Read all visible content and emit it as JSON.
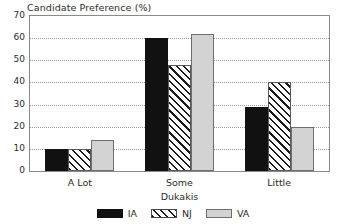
{
  "chart_data": {
    "type": "bar",
    "title": "Candidate Preference (%)",
    "xlabel": "Dukakis",
    "ylabel": "",
    "categories": [
      "A Lot",
      "Some",
      "Little"
    ],
    "series": [
      {
        "name": "IA",
        "values": [
          10,
          60,
          29
        ],
        "color": "#111111",
        "fill": "solid"
      },
      {
        "name": "NJ",
        "values": [
          10,
          48,
          40
        ],
        "color": "#1a1a1a",
        "fill": "diagonal-hatch"
      },
      {
        "name": "VA",
        "values": [
          14,
          62,
          20
        ],
        "color": "#d2d2d2",
        "fill": "solid-light-gray"
      }
    ],
    "ylim": [
      0,
      70
    ],
    "yticks": [
      0,
      10,
      20,
      30,
      40,
      50,
      60,
      70
    ],
    "ytick_labels": [
      "0",
      "10",
      "20",
      "30",
      "40",
      "50",
      "60",
      "70"
    ],
    "grid": "horizontal-dotted",
    "legend_position": "bottom-center",
    "legend_entries": [
      "IA",
      "NJ",
      "VA"
    ]
  }
}
